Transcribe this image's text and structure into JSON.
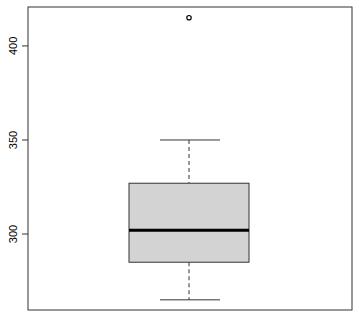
{
  "chart_data": {
    "type": "boxplot",
    "title": "",
    "xlabel": "",
    "ylabel": "",
    "ylim": [
      259.6,
      420.7
    ],
    "yticks": [
      300,
      350,
      400
    ],
    "ytick_labels": [
      "300",
      "350",
      "400"
    ],
    "grid": false,
    "legend": null,
    "series": [
      {
        "name": "",
        "lower_whisker": 265,
        "q1": 285,
        "median": 302,
        "q3": 327,
        "upper_whisker": 350,
        "outliers": [
          415
        ]
      }
    ],
    "colors": {
      "box_fill": "#d3d3d3",
      "box_border": "#333333",
      "median": "#000000",
      "whisker": "#333333",
      "frame": "#333333"
    }
  }
}
